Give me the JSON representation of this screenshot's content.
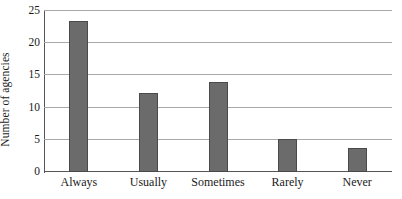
{
  "chart_data": {
    "type": "bar",
    "title": "",
    "subtitle": "",
    "xlabel": "",
    "ylabel": "Number of agencies",
    "categories": [
      "Always",
      "Usually",
      "Sometimes",
      "Rarely",
      "Never"
    ],
    "values": [
      23.5,
      12.2,
      14.0,
      5.1,
      3.8
    ],
    "ylim": [
      0,
      25
    ],
    "ytick_values": [
      0,
      5,
      10,
      15,
      20,
      25
    ],
    "ytick_labels": [
      "0",
      "5",
      "10",
      "15",
      "20",
      "25"
    ],
    "grid": true,
    "grid_axis": "y",
    "legend": false,
    "legend_position": "none",
    "bar_color": "#6b6b6b",
    "bar_edge_color": "#4a4a4a",
    "gridline_color": "#a9a9a9",
    "axis_color": "#555555",
    "background_color": "#ffffff"
  },
  "axes": {
    "y_title": "Number of agencies",
    "ticks": [
      {
        "label": "25",
        "value": 25
      },
      {
        "label": "20",
        "value": 20
      },
      {
        "label": "15",
        "value": 15
      },
      {
        "label": "10",
        "value": 10
      },
      {
        "label": "5",
        "value": 5
      },
      {
        "label": "0",
        "value": 0
      }
    ]
  },
  "bars": [
    {
      "label": "Always",
      "value": 23.5
    },
    {
      "label": "Usually",
      "value": 12.2
    },
    {
      "label": "Sometimes",
      "value": 14.0
    },
    {
      "label": "Rarely",
      "value": 5.1
    },
    {
      "label": "Never",
      "value": 3.8
    }
  ]
}
